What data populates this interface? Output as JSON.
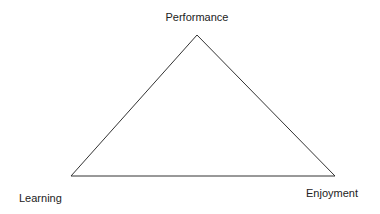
{
  "diagram": {
    "type": "triangle",
    "line_color": "#333333",
    "vertices": {
      "top": {
        "label": "Performance",
        "x": 197,
        "y": 35
      },
      "bottom_left": {
        "label": "Learning",
        "x": 71,
        "y": 176
      },
      "bottom_right": {
        "label": "Enjoyment",
        "x": 335,
        "y": 176
      }
    }
  }
}
